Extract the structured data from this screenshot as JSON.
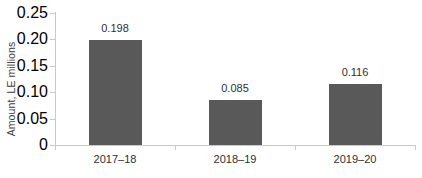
{
  "chart_data": {
    "type": "bar",
    "title": "",
    "subtitle": "",
    "xlabel": "",
    "ylabel": "Amount, LE millions",
    "categories": [
      "2017–18",
      "2018–19",
      "2019–20"
    ],
    "values": [
      0.198,
      0.085,
      0.116
    ],
    "value_labels": [
      "0.198",
      "0.085",
      "0.116"
    ],
    "ylim": [
      0,
      0.25
    ],
    "yticks": [
      0,
      0.05,
      0.1,
      0.15,
      0.2,
      0.25
    ],
    "ytick_labels": [
      "0",
      "0.05",
      "0.10",
      "0.15",
      "0.20",
      "0.25"
    ],
    "grid": false,
    "legend": false,
    "legend_position": "none",
    "series": [
      {
        "name": "Amount",
        "values": [
          0.198,
          0.085,
          0.116
        ],
        "color": "#595959"
      }
    ],
    "colors": {
      "bar": "#595959",
      "axis": "#c9c9c9",
      "text": "#2f2f2f",
      "background": "#ffffff"
    }
  },
  "axis": {
    "y_title": "Amount, LE millions"
  }
}
